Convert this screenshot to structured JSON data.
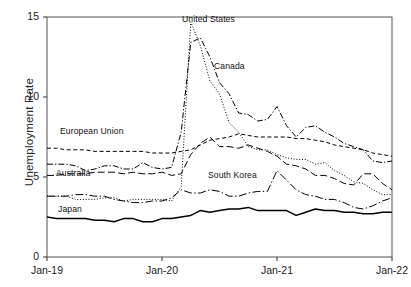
{
  "chart_data": {
    "type": "line",
    "title": "",
    "xlabel": "",
    "ylabel": "Unemployment Rate",
    "ylim": [
      0,
      15
    ],
    "yticks": [
      0,
      5,
      10,
      15
    ],
    "ytick_labels": [
      "0",
      "5",
      "10",
      "15"
    ],
    "xtick_labels": [
      "Jan-19",
      "Jan-20",
      "Jan-21",
      "Jan-22"
    ],
    "xtick_positions": [
      0,
      12,
      24,
      36
    ],
    "grid": false,
    "legend_position": "inline-annotations",
    "x": [
      0,
      1,
      2,
      3,
      4,
      5,
      6,
      7,
      8,
      9,
      10,
      11,
      12,
      13,
      14,
      15,
      16,
      17,
      18,
      19,
      20,
      21,
      22,
      23,
      24,
      25,
      26,
      27,
      28,
      29,
      30,
      31,
      32,
      33,
      34,
      35,
      36
    ],
    "series": [
      {
        "name": "United States",
        "style": "dotted",
        "color": "#000000",
        "label_x": 182,
        "label_y": 14,
        "values": [
          3.8,
          3.8,
          3.8,
          3.6,
          3.6,
          3.6,
          3.7,
          3.7,
          3.5,
          3.6,
          3.6,
          3.6,
          3.6,
          3.5,
          4.4,
          14.7,
          13.2,
          11.0,
          10.2,
          8.4,
          7.8,
          6.9,
          6.7,
          6.7,
          6.4,
          6.2,
          6.1,
          6.1,
          5.8,
          5.9,
          5.4,
          5.1,
          4.7,
          4.6,
          4.2,
          3.9,
          3.9
        ]
      },
      {
        "name": "Canada",
        "style": "dashdot",
        "color": "#000000",
        "label_x": 214,
        "label_y": 61,
        "values": [
          5.8,
          5.8,
          5.8,
          5.7,
          5.4,
          5.5,
          5.7,
          5.7,
          5.5,
          5.5,
          5.9,
          5.6,
          5.5,
          5.6,
          7.8,
          13.4,
          13.7,
          12.5,
          10.9,
          10.2,
          9.0,
          8.9,
          8.5,
          8.6,
          9.4,
          8.2,
          7.5,
          8.1,
          8.2,
          7.8,
          7.5,
          7.1,
          6.9,
          6.7,
          6.0,
          5.9,
          6.0
        ]
      },
      {
        "name": "European Union",
        "style": "dashed",
        "color": "#000000",
        "label_x": 60,
        "label_y": 126,
        "values": [
          6.8,
          6.8,
          6.7,
          6.7,
          6.7,
          6.6,
          6.6,
          6.6,
          6.6,
          6.6,
          6.6,
          6.5,
          6.5,
          6.5,
          6.6,
          6.7,
          7.0,
          7.3,
          7.4,
          7.5,
          7.7,
          7.6,
          7.5,
          7.5,
          7.5,
          7.5,
          7.4,
          7.4,
          7.3,
          7.2,
          7.0,
          6.9,
          6.8,
          6.7,
          6.5,
          6.4,
          6.3
        ]
      },
      {
        "name": "Australia",
        "style": "longdash",
        "color": "#000000",
        "label_x": 56,
        "label_y": 168,
        "values": [
          5.1,
          5.1,
          5.2,
          5.2,
          5.2,
          5.3,
          5.3,
          5.3,
          5.2,
          5.3,
          5.2,
          5.2,
          5.3,
          5.1,
          5.2,
          6.4,
          7.1,
          7.5,
          6.9,
          6.9,
          6.8,
          7.0,
          6.8,
          6.6,
          6.3,
          5.8,
          5.7,
          5.5,
          5.1,
          5.1,
          4.9,
          4.6,
          4.5,
          5.2,
          5.2,
          4.6,
          4.2
        ]
      },
      {
        "name": "South Korea",
        "style": "dashdotlong",
        "color": "#000000",
        "label_x": 208,
        "label_y": 170,
        "values": [
          3.8,
          3.8,
          3.8,
          3.9,
          3.9,
          3.8,
          3.8,
          3.6,
          3.5,
          3.4,
          3.4,
          3.5,
          3.5,
          3.7,
          4.2,
          4.0,
          4.0,
          4.2,
          4.1,
          3.8,
          3.8,
          4.0,
          4.1,
          4.1,
          5.4,
          4.8,
          4.2,
          3.9,
          3.8,
          3.6,
          3.6,
          3.4,
          3.1,
          3.0,
          3.2,
          3.5,
          3.7
        ]
      },
      {
        "name": "Japan",
        "style": "solid",
        "color": "#000000",
        "label_x": 58,
        "label_y": 204,
        "values": [
          2.5,
          2.4,
          2.4,
          2.4,
          2.4,
          2.3,
          2.3,
          2.2,
          2.4,
          2.4,
          2.2,
          2.2,
          2.4,
          2.4,
          2.5,
          2.6,
          2.9,
          2.8,
          2.9,
          3.0,
          3.0,
          3.1,
          2.9,
          2.9,
          2.9,
          2.9,
          2.6,
          2.8,
          3.0,
          2.9,
          2.9,
          2.8,
          2.8,
          2.7,
          2.7,
          2.8,
          2.8
        ]
      }
    ]
  }
}
